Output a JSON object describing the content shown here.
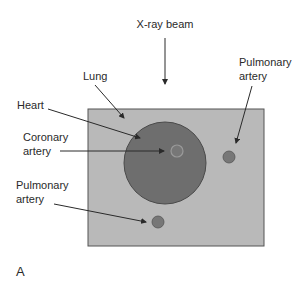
{
  "diagram": {
    "panel_label": "A",
    "labels": {
      "beam": "X-ray beam",
      "lung": "Lung",
      "heart": "Heart",
      "coronary_line1": "Coronary",
      "coronary_line2": "artery",
      "pulm_right_line1": "Pulmonary",
      "pulm_right_line2": "artery",
      "pulm_left_line1": "Pulmonary",
      "pulm_left_line2": "artery"
    },
    "colors": {
      "lung_fill": "#b9b9b9",
      "heart_fill": "#6e6e6e",
      "vessel_fill": "#777777",
      "stroke": "#3a3a3a",
      "text": "#2a2a2a"
    }
  }
}
